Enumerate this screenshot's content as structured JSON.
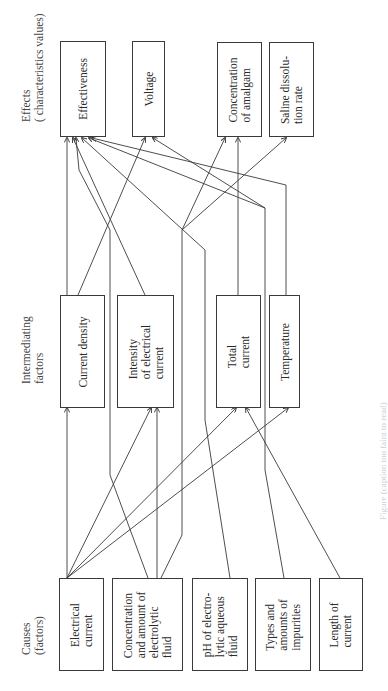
{
  "diagram": {
    "orientation": "rotated 90deg counter-clockwise",
    "columns": {
      "effects_label": "Effects\n( characteristics values)",
      "intermediating_label": "Intermediating\nfactors",
      "causes_label": "Causes\n(factors)"
    },
    "effects": [
      {
        "id": "effectiveness",
        "label": "Effectiveness"
      },
      {
        "id": "voltage",
        "label": "Voltage"
      },
      {
        "id": "concentration-amalgam",
        "label": "Concentration\nof amalgam"
      },
      {
        "id": "saline-dissolution",
        "label": "Saline dissolu-\ntion rate"
      }
    ],
    "intermediates": [
      {
        "id": "current-density",
        "label": "Current density"
      },
      {
        "id": "intensity-current",
        "label": "Intensity\nof electrical\ncurrent"
      },
      {
        "id": "total-current",
        "label": "Total\ncurrent"
      },
      {
        "id": "temperature",
        "label": "Temperature"
      }
    ],
    "causes": [
      {
        "id": "electrical-current",
        "label": "Electrical\ncurrent"
      },
      {
        "id": "concentration-electrolytic",
        "label": "Concentration\nand amount of\nelectrolytic\nfluid"
      },
      {
        "id": "ph-fluid",
        "label": "pH of electro-\nlytic aqueous\nfluid"
      },
      {
        "id": "impurities",
        "label": "Types and\namounts of\nimpurities"
      },
      {
        "id": "length-current",
        "label": "Length of\ncurrent"
      }
    ],
    "edges": [
      {
        "from": "electrical-current",
        "to": "current-density"
      },
      {
        "from": "electrical-current",
        "to": "intensity-current"
      },
      {
        "from": "electrical-current",
        "to": "total-current"
      },
      {
        "from": "electrical-current",
        "to": "temperature"
      },
      {
        "from": "concentration-electrolytic",
        "to": "intensity-current"
      },
      {
        "from": "concentration-electrolytic",
        "to": "effectiveness"
      },
      {
        "from": "concentration-electrolytic",
        "to": "concentration-amalgam"
      },
      {
        "from": "ph-fluid",
        "to": "effectiveness"
      },
      {
        "from": "impurities",
        "to": "total-current"
      },
      {
        "from": "impurities",
        "to": "effectiveness"
      },
      {
        "from": "length-current",
        "to": "total-current"
      },
      {
        "from": "current-density",
        "to": "effectiveness"
      },
      {
        "from": "current-density",
        "to": "voltage"
      },
      {
        "from": "intensity-current",
        "to": "effectiveness"
      },
      {
        "from": "intensity-current",
        "to": "concentration-amalgam"
      },
      {
        "from": "intensity-current",
        "to": "saline-dissolution"
      },
      {
        "from": "total-current",
        "to": "concentration-amalgam"
      },
      {
        "from": "temperature",
        "to": "effectiveness"
      },
      {
        "from": "temperature",
        "to": "voltage"
      }
    ],
    "caption": "Figure (caption too faint to read)"
  }
}
